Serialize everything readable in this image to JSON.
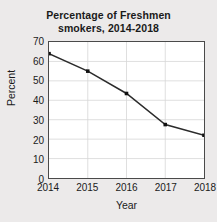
{
  "chart_data": {
    "type": "line",
    "title": "Percentage of Freshmen smokers, 2014-2018",
    "title_lines": [
      "Percentage of Freshmen",
      "smokers, 2014-2018"
    ],
    "categories": [
      "2014",
      "2015",
      "2016",
      "2017",
      "2018"
    ],
    "values": [
      64,
      55,
      43.5,
      27.5,
      22
    ],
    "xlabel": "Year",
    "ylabel": "Percent",
    "xlim": [
      "2014",
      "2018"
    ],
    "ylim": [
      0,
      70
    ],
    "yticks": [
      0,
      10,
      20,
      30,
      40,
      50,
      60,
      70
    ],
    "ytick_labels": [
      "0",
      "10",
      "20",
      "30",
      "40",
      "50",
      "60",
      "70"
    ],
    "xticks": [
      "2014",
      "2015",
      "2016",
      "2017",
      "2018"
    ],
    "grid": true,
    "grid_color": "#d6d6d6",
    "legend": false,
    "series": [
      {
        "name": "Percentage of Freshmen smokers",
        "values": [
          64,
          55,
          43.5,
          27.5,
          22
        ],
        "line_color": "#2b2b2b",
        "marker": "square",
        "marker_color": "#111111"
      }
    ],
    "background_color": "#eceaea",
    "plot_background_color": "#ffffff",
    "axis_color": "#4a4a4a"
  }
}
